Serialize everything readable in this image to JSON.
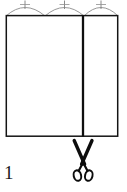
{
  "figure": {
    "label": "1",
    "colors": {
      "background": "#ffffff",
      "outline": "#111111",
      "arc": "#888888",
      "tick": "#777777",
      "scissors": "#0d0d0d"
    },
    "rectangle": {
      "name": "fabric-panel-rectangle",
      "x": 6,
      "y": 15,
      "width": 112,
      "height": 121,
      "stroke_width": 1.6
    },
    "fold_line": {
      "name": "cut-line",
      "x": 83,
      "y_top": 15,
      "y_bottom": 136,
      "stroke_width": 2.2
    },
    "arcs": [
      {
        "name": "arc-left",
        "x_start": 6,
        "x_end": 45,
        "apex_x": 25,
        "apex_y": 4,
        "tick_x": 25
      },
      {
        "name": "arc-middle",
        "x_start": 45,
        "x_end": 84,
        "apex_x": 64,
        "apex_y": 4,
        "tick_x": 64
      },
      {
        "name": "arc-right",
        "x_start": 84,
        "x_end": 118,
        "apex_x": 101,
        "apex_y": 4,
        "tick_x": 101
      }
    ],
    "tick_marks": {
      "name": "arc-apex-tick",
      "count": 3,
      "half_length": 4
    },
    "scissors": {
      "name": "scissors-icon",
      "center_x": 83,
      "top_y": 140,
      "bottom_y": 182,
      "pivot_y": 163
    }
  }
}
